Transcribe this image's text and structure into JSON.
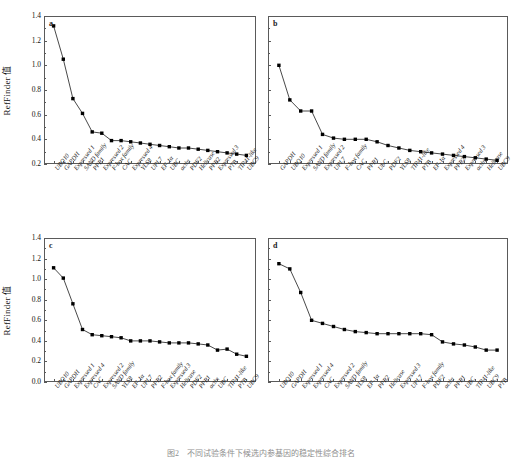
{
  "figure": {
    "caption": "图2　不同试验条件下候选内参基因的稳定性综合排名",
    "y_axis_label": "RefFinder 值",
    "marker_color": "#000000",
    "line_color": "#1a1a1a",
    "axis_color": "#5a5a5a"
  },
  "chart_data": [
    {
      "type": "line",
      "panel": "a",
      "title": "",
      "xlabel": "",
      "ylabel": "RefFinder 值",
      "ylim": [
        0.2,
        1.4
      ],
      "yticks": [
        0.2,
        0.4,
        0.6,
        0.8,
        1.0,
        1.2,
        1.4
      ],
      "grid": false,
      "legend": "none",
      "categories": [
        "UBQ10",
        "GAPDH",
        "Expressed 1",
        "SAND family",
        "PPR1",
        "Expressed 2",
        "F-box family",
        "CAC",
        "Expressed 4",
        "YLS8",
        "UPL7",
        "EF-1α",
        "UBC",
        "actin",
        "PDF2",
        "Helicase",
        "PPR2",
        "Expressed 3",
        "PTB",
        "TIP41-like",
        "UBC9"
      ],
      "values": [
        1.32,
        1.05,
        0.73,
        0.61,
        0.46,
        0.45,
        0.39,
        0.39,
        0.38,
        0.37,
        0.36,
        0.35,
        0.34,
        0.33,
        0.33,
        0.32,
        0.31,
        0.3,
        0.29,
        0.28,
        0.27
      ]
    },
    {
      "type": "line",
      "panel": "b",
      "title": "",
      "xlabel": "",
      "ylabel": "",
      "ylim": [
        0.2,
        1.4
      ],
      "yticks": [
        0.2,
        0.4,
        0.6,
        0.8,
        1.0,
        1.2,
        1.4
      ],
      "grid": false,
      "legend": "none",
      "categories": [
        "GAPDH",
        "UBQ10",
        "Expressed 1",
        "SAND family",
        "Expressed 2",
        "UPL7",
        "F-box family",
        "CAC",
        "PPR1",
        "UbC",
        "PDF2",
        "YLS8",
        "TIP41-like",
        "PTB",
        "EF-1α",
        "Expressed 4",
        "PPR2",
        "Expressed 3",
        "actin",
        "Helicase",
        "UBC9"
      ],
      "values": [
        1.0,
        0.72,
        0.63,
        0.63,
        0.44,
        0.41,
        0.4,
        0.4,
        0.4,
        0.38,
        0.35,
        0.33,
        0.31,
        0.3,
        0.29,
        0.28,
        0.27,
        0.26,
        0.25,
        0.24,
        0.23
      ]
    },
    {
      "type": "line",
      "panel": "c",
      "title": "",
      "xlabel": "",
      "ylabel": "RefFinder 值",
      "ylim": [
        0.0,
        1.4
      ],
      "yticks": [
        0.0,
        0.2,
        0.4,
        0.6,
        0.8,
        1.0,
        1.2,
        1.4
      ],
      "grid": false,
      "legend": "none",
      "categories": [
        "UBQ10",
        "GAPDH",
        "Expressed 1",
        "Expressed 4",
        "CAC",
        "Expressed 2",
        "SAND family",
        "YLS8",
        "EF-1α",
        "UPL7",
        "PPR2",
        "F-box family",
        "Expressed 3",
        "Helicase",
        "PDF2",
        "PPR1",
        "actin",
        "UBC",
        "TIP41-like",
        "PTB",
        "UBC9"
      ],
      "values": [
        1.11,
        1.01,
        0.76,
        0.51,
        0.46,
        0.45,
        0.44,
        0.43,
        0.4,
        0.4,
        0.4,
        0.39,
        0.38,
        0.38,
        0.38,
        0.37,
        0.36,
        0.31,
        0.32,
        0.27,
        0.25
      ]
    },
    {
      "type": "line",
      "panel": "d",
      "title": "",
      "xlabel": "",
      "ylabel": "",
      "ylim": [
        0.0,
        1.4
      ],
      "yticks": [
        0.0,
        0.2,
        0.4,
        0.6,
        0.8,
        1.0,
        1.2,
        1.4
      ],
      "grid": false,
      "legend": "none",
      "categories": [
        "UBQ10",
        "GAPDH",
        "Expressed 1",
        "Expressed 4",
        "CAC",
        "Expressed 2",
        "SAND family",
        "YLS8",
        "EF-1α",
        "PPR2",
        "Helicase",
        "Expressed 3",
        "UPL7",
        "F-box family",
        "PDF2",
        "actin",
        "PPR1",
        "UBC",
        "TIP41-like",
        "UBC9",
        "PTB"
      ],
      "values": [
        1.15,
        1.1,
        0.87,
        0.6,
        0.57,
        0.54,
        0.51,
        0.49,
        0.48,
        0.47,
        0.47,
        0.47,
        0.47,
        0.47,
        0.46,
        0.39,
        0.37,
        0.36,
        0.34,
        0.31,
        0.31
      ]
    }
  ]
}
